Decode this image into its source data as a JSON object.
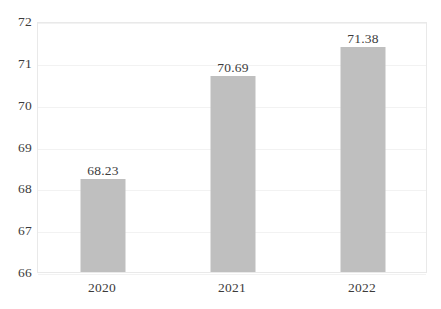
{
  "chart_data": {
    "type": "bar",
    "title": "",
    "subtitle": "",
    "xlabel": "",
    "ylabel": "",
    "categories": [
      "2020",
      "2021",
      "2022"
    ],
    "values": [
      68.23,
      70.69,
      71.38
    ],
    "data_labels": [
      "68.23",
      "70.69",
      "71.38"
    ],
    "ylim": [
      66,
      72
    ],
    "ytick_values": [
      66,
      67,
      68,
      69,
      70,
      71,
      72
    ],
    "ytick_labels": [
      "66",
      "67",
      "68",
      "69",
      "70",
      "71",
      "72"
    ],
    "ytick_step": 1,
    "grid": true,
    "grid_axis": "y",
    "legend": false,
    "legend_position": "none",
    "series": [
      {
        "name": "",
        "values": [
          68.23,
          70.69,
          71.38
        ]
      }
    ],
    "colors": {
      "bar_fill": "#BFBFBF",
      "plot_background": "#FFFFFF",
      "plot_border": "#E9E9E9",
      "gridline": "#F2F2F2",
      "text": "#3B3B3B"
    }
  }
}
